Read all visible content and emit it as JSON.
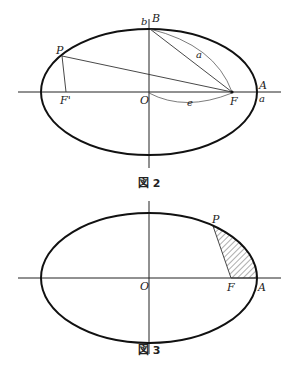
{
  "figure2": {
    "caption": "図 2",
    "labels": {
      "b": "b",
      "B": "B",
      "P": "P",
      "a_line": "a",
      "F_prime": "F'",
      "O": "O",
      "e": "e",
      "F": "F",
      "A": "A",
      "a_axis": "a"
    }
  },
  "figure3": {
    "caption": "図 3",
    "labels": {
      "P": "P",
      "O": "O",
      "F": "F",
      "A": "A"
    }
  }
}
